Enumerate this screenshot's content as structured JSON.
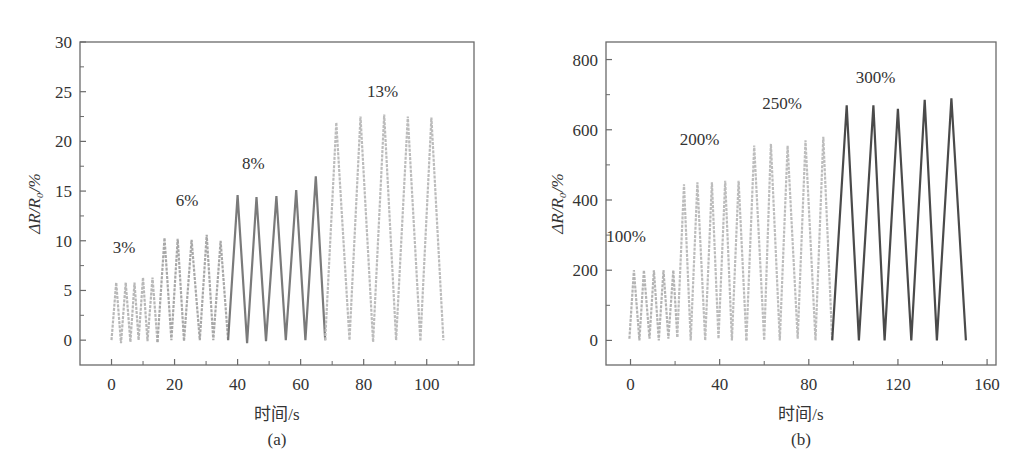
{
  "figure": {
    "panels": [
      "(a)",
      "(b)"
    ]
  },
  "chart_data": [
    {
      "type": "line",
      "panel_label": "(a)",
      "title": "",
      "xlabel": "时间/s",
      "ylabel": "ΔR/R₀/%",
      "xlim": [
        -10,
        115
      ],
      "ylim": [
        -2.5,
        30
      ],
      "xticks": [
        0,
        20,
        40,
        60,
        80,
        100
      ],
      "yticks": [
        0,
        5,
        10,
        15,
        20,
        25,
        30
      ],
      "grid": false,
      "legend": null,
      "series": [
        {
          "name": "3%",
          "color": "#b8b8b8",
          "x": [
            0,
            1.5,
            3,
            4.5,
            6,
            7.3,
            8.6,
            10,
            11.4,
            13,
            14.6
          ],
          "y": [
            0,
            5.8,
            -0.3,
            5.8,
            -0.2,
            5.8,
            0,
            6.3,
            -0.1,
            6.3,
            -0.2
          ],
          "label_pos": [
            4,
            8.8
          ]
        },
        {
          "name": "6%",
          "color": "#a8a8a8",
          "x": [
            14.6,
            16.8,
            19,
            21,
            23,
            25.4,
            28,
            30.2,
            32.3,
            34.6,
            37
          ],
          "y": [
            -0.2,
            10.3,
            0,
            10.2,
            -0.1,
            10.1,
            0,
            10.6,
            0,
            10,
            0
          ],
          "label_pos": [
            24,
            13.5
          ]
        },
        {
          "name": "8%",
          "color": "#7a7a7a",
          "x": [
            37,
            40,
            43,
            46,
            49,
            52.3,
            55.3,
            58.6,
            61.5,
            64.8,
            67.8
          ],
          "y": [
            0,
            14.6,
            -0.3,
            14.4,
            -0.1,
            14.5,
            0,
            15.1,
            0,
            16.5,
            0
          ],
          "label_pos": [
            45,
            17.2
          ]
        },
        {
          "name": "13%",
          "color": "#bcbcbc",
          "x": [
            67.8,
            71.3,
            75.5,
            79,
            83,
            86.5,
            90.3,
            94,
            98,
            101.5,
            105.3
          ],
          "y": [
            0,
            21.9,
            0,
            22.5,
            -0.2,
            22.7,
            0,
            22.5,
            -0.1,
            22.4,
            0
          ],
          "label_pos": [
            86,
            24.5
          ]
        }
      ],
      "annotations": [
        "3%",
        "6%",
        "8%",
        "13%"
      ]
    },
    {
      "type": "line",
      "panel_label": "(b)",
      "title": "",
      "xlabel": "时间/s",
      "ylabel": "ΔR/R₀/%",
      "xlim": [
        -11,
        164
      ],
      "ylim": [
        -70,
        850
      ],
      "xticks": [
        0,
        40,
        80,
        120,
        160
      ],
      "yticks": [
        0,
        200,
        400,
        600,
        800
      ],
      "grid": false,
      "legend": null,
      "series": [
        {
          "name": "100%",
          "color": "#b4b4b4",
          "x": [
            -0.5,
            1.5,
            4,
            6,
            8.5,
            10.5,
            12.7,
            14.8,
            17,
            19.2,
            21
          ],
          "y": [
            5,
            200,
            0,
            200,
            5,
            200,
            0,
            200,
            5,
            200,
            10
          ],
          "label_pos": [
            -2,
            280
          ]
        },
        {
          "name": "200%",
          "color": "#bcbcbc",
          "x": [
            21,
            24,
            27,
            30,
            33.5,
            36.5,
            39.5,
            42.5,
            45.5,
            48.5,
            52
          ],
          "y": [
            10,
            445,
            0,
            450,
            0,
            450,
            5,
            455,
            0,
            455,
            0
          ],
          "label_pos": [
            31,
            556
          ]
        },
        {
          "name": "250%",
          "color": "#bdbdbd",
          "x": [
            52,
            55.5,
            60,
            63,
            67,
            70.5,
            75,
            78.5,
            83,
            86.5,
            90.5
          ],
          "y": [
            0,
            555,
            0,
            560,
            0,
            555,
            5,
            570,
            0,
            580,
            0
          ],
          "label_pos": [
            68,
            660
          ]
        },
        {
          "name": "300%",
          "color": "#4a4a4a",
          "x": [
            90.5,
            97,
            102.5,
            109,
            114,
            120,
            126,
            132,
            137.5,
            144,
            150.5
          ],
          "y": [
            0,
            670,
            0,
            670,
            0,
            660,
            0,
            685,
            0,
            690,
            0
          ],
          "label_pos": [
            110,
            732
          ]
        }
      ],
      "annotations": [
        "100%",
        "200%",
        "250%",
        "300%"
      ]
    }
  ]
}
